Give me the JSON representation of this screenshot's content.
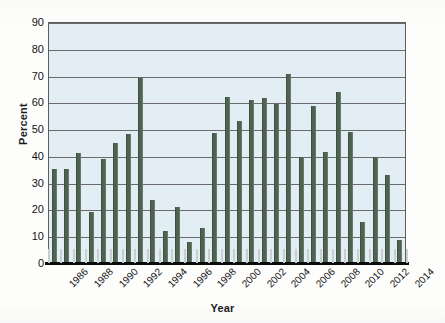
{
  "chart_data": {
    "type": "bar",
    "title": "",
    "xlabel": "Year",
    "ylabel": "Percent",
    "ylim": [
      0,
      90
    ],
    "yticks": [
      0,
      10,
      20,
      30,
      40,
      50,
      60,
      70,
      80,
      90
    ],
    "grid": true,
    "legend": "none",
    "xtick_labels": [
      "1986",
      "1988",
      "1990",
      "1992",
      "1994",
      "1996",
      "1998",
      "2000",
      "2002",
      "2004",
      "2006",
      "2008",
      "2010",
      "2012",
      "2014"
    ],
    "categories": [
      "1986",
      "1987",
      "1988",
      "1989",
      "1990",
      "1991",
      "1992",
      "1993",
      "1994",
      "1995",
      "1996",
      "1997",
      "1998",
      "1999",
      "2000",
      "2001",
      "2002",
      "2003",
      "2004",
      "2005",
      "2006",
      "2007",
      "2008",
      "2009",
      "2010",
      "2011",
      "2012",
      "2013",
      "2014"
    ],
    "values": [
      35,
      35,
      41,
      19,
      39,
      45,
      48,
      69,
      23.5,
      12,
      21,
      8,
      13,
      48.5,
      62,
      53,
      61,
      61.5,
      59.5,
      70.5,
      39.5,
      58.5,
      41.5,
      64,
      49,
      15.5,
      39.5,
      33,
      8.5
    ],
    "bar_color": "#4f6352",
    "plot_background": "#e2eef4"
  },
  "axis": {
    "y_title": "Percent",
    "x_title": "Year"
  }
}
